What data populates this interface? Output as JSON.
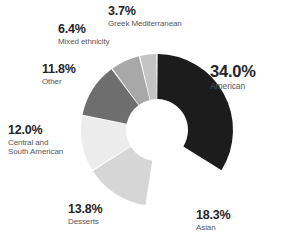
{
  "chart_data": {
    "type": "pie",
    "variant": "donut",
    "title": "",
    "subtitle": "",
    "xlabel": "",
    "ylabel": "",
    "legend_position": "none",
    "grid": false,
    "value_suffix": "%",
    "categories": [
      "American",
      "Asian",
      "Desserts",
      "Central and South American",
      "Other",
      "Mixed ethnicity",
      "Greek Mediterranean"
    ],
    "values": [
      34.0,
      18.3,
      13.8,
      12.0,
      11.8,
      6.4,
      3.7
    ],
    "colors": [
      "#1c1c1c",
      "#ffffff",
      "#d6d6d6",
      "#ececec",
      "#6e6e6e",
      "#a8a8a8",
      "#c4c4c4"
    ],
    "slices": [
      {
        "label": "American",
        "value": 34.0,
        "display_value": "34.0%",
        "color": "#1c1c1c",
        "name_lines": [
          "American"
        ]
      },
      {
        "label": "Asian",
        "value": 18.3,
        "display_value": "18.3%",
        "color": "#ffffff",
        "name_lines": [
          "Asian"
        ]
      },
      {
        "label": "Desserts",
        "value": 13.8,
        "display_value": "13.8%",
        "color": "#d6d6d6",
        "name_lines": [
          "Desserts"
        ]
      },
      {
        "label": "Central and South American",
        "value": 12.0,
        "display_value": "12.0%",
        "color": "#ececec",
        "name_lines": [
          "Central and",
          "South American"
        ]
      },
      {
        "label": "Other",
        "value": 11.8,
        "display_value": "11.8%",
        "color": "#6e6e6e",
        "name_lines": [
          "Other"
        ]
      },
      {
        "label": "Mixed ethnicity",
        "value": 6.4,
        "display_value": "6.4%",
        "color": "#a8a8a8",
        "name_lines": [
          "Mixed ethnicity"
        ]
      },
      {
        "label": "Greek Mediterranean",
        "value": 3.7,
        "display_value": "3.7%",
        "color": "#c4c4c4",
        "name_lines": [
          "Greek Mediterranean"
        ]
      }
    ]
  },
  "style": {
    "background": "#ffffff",
    "percent_color": "#24242a",
    "category_color": "#565660"
  }
}
